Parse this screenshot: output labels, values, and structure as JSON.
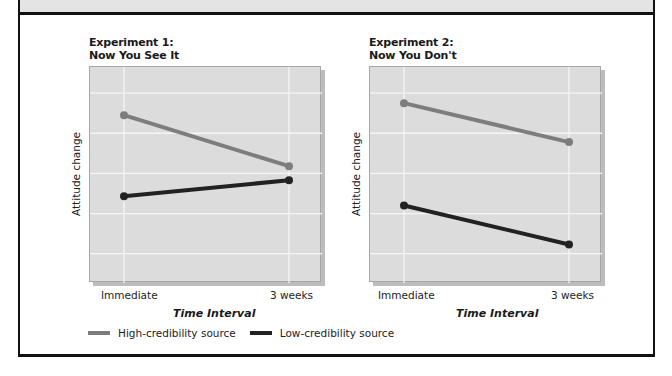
{
  "colors": {
    "high": "#7d7d7d",
    "low": "#222222",
    "plot_bg": "#dcdcdc",
    "grid": "#f5f5f5",
    "frame": "#111111",
    "header_band": "#e4e4e4"
  },
  "legend": {
    "items": [
      {
        "label": "High-credibility source",
        "color": "#7d7d7d"
      },
      {
        "label": "Low-credibility source",
        "color": "#222222"
      }
    ]
  },
  "charts": [
    {
      "title_line1": "Experiment 1:",
      "title_line2": "Now You See It",
      "ylabel": "Attitude change",
      "xlabel": "Time Interval",
      "xticks": [
        "Immediate",
        "3 weeks"
      ]
    },
    {
      "title_line1": "Experiment 2:",
      "title_line2": "Now You Don't",
      "ylabel": "Attitude change",
      "xlabel": "Time Interval",
      "xticks": [
        "Immediate",
        "3 weeks"
      ]
    }
  ],
  "chart_data": [
    {
      "type": "line",
      "title": "Experiment 1: Now You See It",
      "xlabel": "Time Interval",
      "ylabel": "Attitude change",
      "categories": [
        "Immediate",
        "3 weeks"
      ],
      "series": [
        {
          "name": "High-credibility source",
          "values": [
            4.45,
            3.18
          ]
        },
        {
          "name": "Low-credibility source",
          "values": [
            2.43,
            2.83
          ]
        }
      ],
      "ylim": [
        0.27,
        5.65
      ],
      "yticks_shown": false,
      "grid": true,
      "legend_position": "bottom-left (shared)"
    },
    {
      "type": "line",
      "title": "Experiment 2: Now You Don't",
      "xlabel": "Time Interval",
      "ylabel": "Attitude change",
      "categories": [
        "Immediate",
        "3 weeks"
      ],
      "series": [
        {
          "name": "High-credibility source",
          "values": [
            4.75,
            3.78
          ]
        },
        {
          "name": "Low-credibility source",
          "values": [
            2.2,
            1.23
          ]
        }
      ],
      "ylim": [
        0.27,
        5.65
      ],
      "yticks_shown": false,
      "grid": true,
      "legend_position": "bottom-left (shared)"
    }
  ]
}
